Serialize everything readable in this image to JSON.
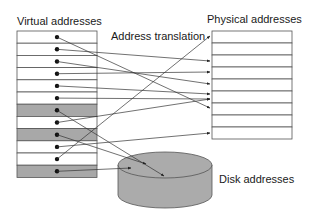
{
  "labels": {
    "virtual": "Virtual addresses",
    "physical": "Physical addresses",
    "translation": "Address translation",
    "disk": "Disk addresses"
  },
  "colors": {
    "line": "#333333",
    "border": "#555555",
    "gray_row": "#a8a8a8",
    "disk_fill": "#ababab",
    "background": "#ffffff"
  },
  "virtual_table": {
    "x": 17,
    "y": 31,
    "width": 80,
    "row_height": 12.2,
    "rows": 12,
    "gray_rows": [
      7,
      9,
      12
    ],
    "dot_x": 57
  },
  "physical_table": {
    "x": 212,
    "y": 31,
    "width": 80,
    "row_height": 12,
    "rows": 9
  },
  "disk": {
    "cx": 165,
    "cy": 165,
    "rx": 47,
    "ry": 13,
    "bottom": 208
  },
  "mappings": [
    {
      "from": 1,
      "to": [
        210,
        108
      ]
    },
    {
      "from": 2,
      "to": [
        210,
        61
      ]
    },
    {
      "from": 3,
      "to": [
        210,
        84
      ]
    },
    {
      "from": 4,
      "to": [
        210,
        72
      ]
    },
    {
      "from": 5,
      "to": [
        210,
        94
      ]
    },
    {
      "from": 6,
      "to": [
        210,
        99
      ]
    },
    {
      "from": 7,
      "to": [
        164,
        176
      ]
    },
    {
      "from": 8,
      "to": [
        210,
        99
      ]
    },
    {
      "from": 9,
      "to": [
        146,
        164
      ]
    },
    {
      "from": 10,
      "to": [
        210,
        133
      ]
    },
    {
      "from": 11,
      "to": [
        210,
        36
      ]
    },
    {
      "from": 12,
      "to": [
        131,
        168
      ]
    }
  ]
}
